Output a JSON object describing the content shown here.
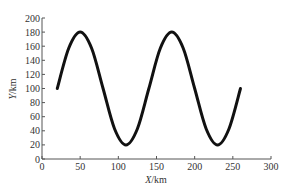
{
  "chart_data": {
    "type": "line",
    "title": "",
    "xlabel": "X/km",
    "ylabel": "Y/km",
    "xlim": [
      0,
      300
    ],
    "ylim": [
      0,
      200
    ],
    "xticks": [
      0,
      50,
      100,
      150,
      200,
      250,
      300
    ],
    "yticks": [
      0,
      20,
      40,
      60,
      80,
      100,
      120,
      140,
      160,
      180,
      200
    ],
    "grid": false,
    "legend": null,
    "series": [
      {
        "name": "trajectory",
        "color": "#111111",
        "description": "sinusoid y = 100 + 80*sin(2*pi*(x-20)/120)",
        "x": [
          20,
          35,
          50,
          65,
          80,
          95,
          110,
          125,
          140,
          155,
          170,
          185,
          200,
          215,
          230,
          245,
          260
        ],
        "y": [
          100,
          157,
          180,
          157,
          100,
          43,
          20,
          43,
          100,
          157,
          180,
          157,
          100,
          43,
          20,
          43,
          100
        ]
      }
    ]
  },
  "axes": {
    "x_label_main": "X",
    "x_label_unit": "/km",
    "y_label_main": "Y",
    "y_label_unit": "/km",
    "color": "#555555"
  }
}
